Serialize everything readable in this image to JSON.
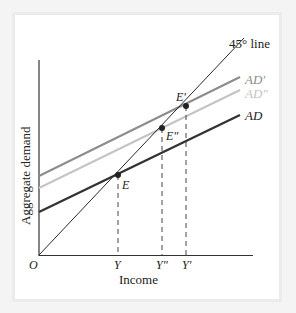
{
  "diagram": {
    "axes": {
      "y_label": "Aggregate demand",
      "x_label": "Income",
      "origin_label": "O"
    },
    "lines": [
      {
        "id": "line45",
        "label": "45° line",
        "color": "#2a2a2a"
      },
      {
        "id": "ad_prime",
        "label": "AD'",
        "color": "#8c8c8c"
      },
      {
        "id": "ad_dprime",
        "label": "AD\"",
        "color": "#c4c4c4"
      },
      {
        "id": "ad",
        "label": "AD",
        "color": "#333333"
      }
    ],
    "equilibria": [
      {
        "label": "E",
        "x_tick": "Y"
      },
      {
        "label": "E\"",
        "x_tick": "Y\""
      },
      {
        "label": "E'",
        "x_tick": "Y'"
      }
    ],
    "x_ticks": [
      "Y",
      "Y\"",
      "Y'"
    ]
  }
}
